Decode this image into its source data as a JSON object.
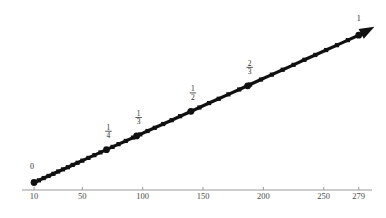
{
  "chart_data": {
    "type": "scatter",
    "title": "",
    "subtitle": "",
    "xlabel": "",
    "ylabel": "",
    "grid": false,
    "legend": null,
    "xlim": [
      0,
      290
    ],
    "ylim": [
      0,
      1.08
    ],
    "xaxis": {
      "tick_values": [
        10,
        50,
        100,
        150,
        200,
        250,
        279
      ],
      "tick_labels": [
        "10",
        "50",
        "100",
        "150",
        "200",
        "250",
        "279"
      ],
      "axis_color": "#999999",
      "label_color": "#4a4a4a"
    },
    "yaxis": {
      "visible": false,
      "tick_values": [],
      "tick_labels": []
    },
    "series": [
      {
        "name": "sequence",
        "marker": "square",
        "color": "#101010",
        "linewidth": 3.2,
        "x": [
          10,
          14,
          18,
          22,
          26,
          30,
          34,
          38,
          42,
          46,
          50,
          55,
          60,
          65,
          70,
          75,
          80,
          86,
          92,
          98,
          104,
          110,
          117,
          124,
          131,
          139,
          147,
          155,
          163,
          171,
          180,
          189,
          198,
          207,
          216,
          225,
          234,
          243,
          252,
          261,
          270,
          279
        ],
        "y": [
          0.036,
          0.05,
          0.065,
          0.079,
          0.093,
          0.108,
          0.122,
          0.136,
          0.151,
          0.165,
          0.179,
          0.197,
          0.215,
          0.233,
          0.251,
          0.269,
          0.287,
          0.308,
          0.33,
          0.351,
          0.373,
          0.394,
          0.419,
          0.444,
          0.47,
          0.498,
          0.527,
          0.556,
          0.584,
          0.613,
          0.645,
          0.677,
          0.71,
          0.742,
          0.774,
          0.806,
          0.839,
          0.871,
          0.903,
          0.935,
          0.968,
          1.0
        ]
      }
    ],
    "annotations": [
      {
        "id": "point-0",
        "text": "0",
        "kind": "plain",
        "x": 10,
        "y": 0.036,
        "label_dx": -2,
        "label_dy": -14,
        "marker": true
      },
      {
        "id": "point-1-4",
        "numerator": "1",
        "denominator": "4",
        "kind": "fraction",
        "x": 70,
        "y": 0.251,
        "label_dx": 2,
        "label_dy": -20,
        "marker": true
      },
      {
        "id": "point-1-3",
        "numerator": "1",
        "denominator": "3",
        "kind": "fraction",
        "x": 95,
        "y": 0.341,
        "label_dx": 2,
        "label_dy": -20,
        "marker": true
      },
      {
        "id": "point-1-2",
        "numerator": "1",
        "denominator": "2",
        "kind": "fraction",
        "x": 140,
        "y": 0.502,
        "label_dx": 2,
        "label_dy": -20,
        "marker": true
      },
      {
        "id": "point-2-3",
        "numerator": "2",
        "denominator": "3",
        "kind": "fraction",
        "x": 187,
        "y": 0.669,
        "label_dx": 2,
        "label_dy": -20,
        "marker": true
      },
      {
        "id": "point-1",
        "text": "1",
        "kind": "plain",
        "x": 279,
        "y": 1.0,
        "label_dx": 0,
        "label_dy": -14,
        "marker": true
      }
    ],
    "arrow": {
      "present": true,
      "direction": "up-right",
      "from_x": 279,
      "from_y": 1.0,
      "to_x": 292,
      "to_y": 1.055
    },
    "colors": {
      "line": "#101010",
      "marker": "#101010",
      "axis": "#999999",
      "text": "#2b2b2b",
      "background": "#ffffff"
    }
  }
}
